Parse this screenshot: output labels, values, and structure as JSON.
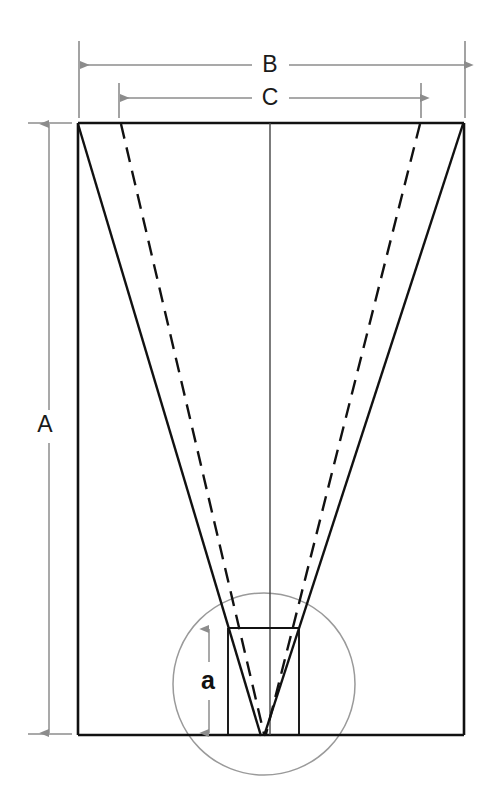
{
  "diagram": {
    "background_color": "#ffffff",
    "outline_color": "#111111",
    "dimension_line_color": "#8c8c8c",
    "circle_color": "#9a9a9a",
    "labels": {
      "width_overall": "B",
      "width_inner": "C",
      "height_overall": "A",
      "height_detail": "a"
    },
    "dimensions": [
      {
        "name": "B",
        "label": "B",
        "orientation": "horizontal",
        "position": "top",
        "from_px": 79,
        "to_px": 465,
        "line_y_px": 65,
        "span_px": 386,
        "description": "Overall outer width of the rectangular body"
      },
      {
        "name": "C",
        "label": "C",
        "orientation": "horizontal",
        "position": "top",
        "from_px": 119,
        "to_px": 421,
        "line_y_px": 98,
        "span_px": 302,
        "description": "Inner width measured between the dashed converging lines"
      },
      {
        "name": "A",
        "label": "A",
        "orientation": "vertical",
        "position": "left",
        "from_px": 123,
        "to_px": 734,
        "line_x_px": 49,
        "span_px": 611,
        "description": "Overall height of the rectangular body"
      },
      {
        "name": "a",
        "label": "a",
        "orientation": "vertical",
        "position": "detail-center",
        "from_px": 628,
        "to_px": 734,
        "line_x_px": 209,
        "span_px": 106,
        "description": "Height of the small detail rectangle at the apex"
      }
    ],
    "shapes": {
      "outer_rectangle": {
        "name": "outer-rectangle",
        "left_px": 78,
        "top_px": 123,
        "right_px": 464,
        "bottom_px": 735
      },
      "detail_rectangle": {
        "name": "detail-rectangle",
        "left_px": 228,
        "top_px": 628,
        "right_px": 299,
        "bottom_px": 735
      },
      "detail_circle": {
        "name": "detail-circle",
        "center_x_px": 264,
        "center_y_px": 684,
        "radius_px": 91
      },
      "center_line": {
        "name": "center-line",
        "x_px": 270,
        "top_px": 123,
        "bottom_px": 735
      },
      "apex": {
        "x_px": 262,
        "y_px": 735
      },
      "solid_left_taper": {
        "from_x_px": 78,
        "from_y_px": 123,
        "to_x_px": 262,
        "to_y_px": 735
      },
      "solid_right_taper": {
        "from_x_px": 463,
        "from_y_px": 123,
        "to_x_px": 264,
        "to_y_px": 735
      },
      "dashed_left_taper": {
        "from_x_px": 121,
        "from_y_px": 124,
        "to_x_px": 264,
        "to_y_px": 733
      },
      "dashed_right_taper": {
        "from_x_px": 420,
        "from_y_px": 124,
        "to_x_px": 266,
        "to_y_px": 733
      }
    }
  }
}
